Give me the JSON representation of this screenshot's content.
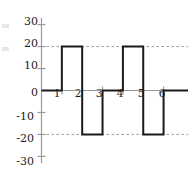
{
  "chart_data": {
    "type": "line",
    "subtype": "square-wave",
    "title": "",
    "xlabel": "",
    "ylabel": "",
    "xlim": [
      0,
      7.2
    ],
    "ylim": [
      -33,
      33
    ],
    "xticks": [
      1,
      2,
      3,
      4,
      5,
      6
    ],
    "xtick_labels": [
      "1",
      "2",
      "3",
      "4",
      "5",
      "6"
    ],
    "yticks": [
      30,
      20,
      10,
      0,
      -10,
      -20,
      -30
    ],
    "ytick_labels": [
      "30",
      "20",
      "10",
      "0",
      "-10",
      "-20",
      "-30"
    ],
    "gridlines": {
      "horizontal_dashed_at": [
        20,
        -20
      ],
      "style": "dashed",
      "color": "#9a9a9a"
    },
    "legend": null,
    "series": [
      {
        "name": "square wave",
        "color": "#1a1a1a",
        "line_width": 2,
        "points": [
          [
            0,
            0
          ],
          [
            1,
            0
          ],
          [
            1,
            20
          ],
          [
            2,
            20
          ],
          [
            2,
            -20
          ],
          [
            3,
            -20
          ],
          [
            3,
            0
          ],
          [
            4,
            0
          ],
          [
            4,
            20
          ],
          [
            5,
            20
          ],
          [
            5,
            -20
          ],
          [
            6,
            -20
          ],
          [
            6,
            0
          ],
          [
            7.2,
            0
          ]
        ],
        "segments": [
          {
            "from_x": 0,
            "to_x": 1,
            "value": 0
          },
          {
            "from_x": 1,
            "to_x": 2,
            "value": 20
          },
          {
            "from_x": 2,
            "to_x": 3,
            "value": -20
          },
          {
            "from_x": 3,
            "to_x": 4,
            "value": 0
          },
          {
            "from_x": 4,
            "to_x": 5,
            "value": 20
          },
          {
            "from_x": 5,
            "to_x": 6,
            "value": -20
          },
          {
            "from_x": 6,
            "to_x": 7.2,
            "value": 0
          }
        ],
        "amplitude": 20,
        "period": 3
      }
    ],
    "axis_color": "#9a9a9a",
    "background": "#ffffff"
  }
}
